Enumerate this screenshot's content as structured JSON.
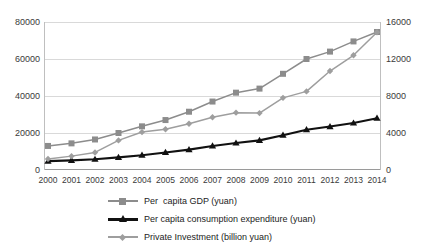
{
  "chart_data": {
    "type": "line",
    "title": "",
    "subtitle": "",
    "xlabel": "",
    "ylabel": "",
    "grid": true,
    "legend_position": "bottom",
    "categories": [
      "2000",
      "2001",
      "2002",
      "2003",
      "2004",
      "2005",
      "2006",
      "2007",
      "2008",
      "2009",
      "2010",
      "2011",
      "2012",
      "2013",
      "2014"
    ],
    "axes": {
      "left": {
        "label": "",
        "ticks": [
          "0",
          "20000",
          "40000",
          "60000",
          "80000"
        ],
        "min": 0,
        "max": 80000
      },
      "right": {
        "label": "",
        "ticks": [
          "0",
          "4000",
          "8000",
          "12000",
          "16000"
        ],
        "min": 0,
        "max": 16000
      },
      "x": {
        "ticks": [
          "2000",
          "2001",
          "2002",
          "2003",
          "2004",
          "2005",
          "2006",
          "2007",
          "2008",
          "2009",
          "2010",
          "2011",
          "2012",
          "2013",
          "2014"
        ]
      }
    },
    "series": [
      {
        "name": "Per  capita GDP (yuan)",
        "axis": "left",
        "marker": "square",
        "color": "#8c8c8c",
        "values": [
          13000,
          14400,
          16500,
          20000,
          23600,
          27000,
          31500,
          37000,
          41800,
          44000,
          52000,
          60000,
          64000,
          69500,
          74600
        ]
      },
      {
        "name": "Per capita consumption expenditure (yuan)",
        "axis": "left",
        "marker": "triangle",
        "color": "#111111",
        "values": [
          4800,
          5200,
          5800,
          6800,
          8000,
          9500,
          11000,
          13000,
          14600,
          16000,
          18800,
          21800,
          23500,
          25400,
          28000
        ]
      },
      {
        "name": "Private Investment (billion yuan)",
        "axis": "right",
        "marker": "diamond",
        "color": "#9e9e9e",
        "values": [
          1200,
          1500,
          1900,
          3200,
          4100,
          4400,
          5000,
          5700,
          6200,
          6150,
          7800,
          8500,
          10700,
          12400,
          14900
        ]
      }
    ]
  },
  "colors": {
    "gdp": "#8c8c8c",
    "consumption": "#111111",
    "investment": "#9e9e9e",
    "gridline": "#d9d9d9",
    "axis": "#9a9a9a",
    "background": "#ffffff"
  }
}
